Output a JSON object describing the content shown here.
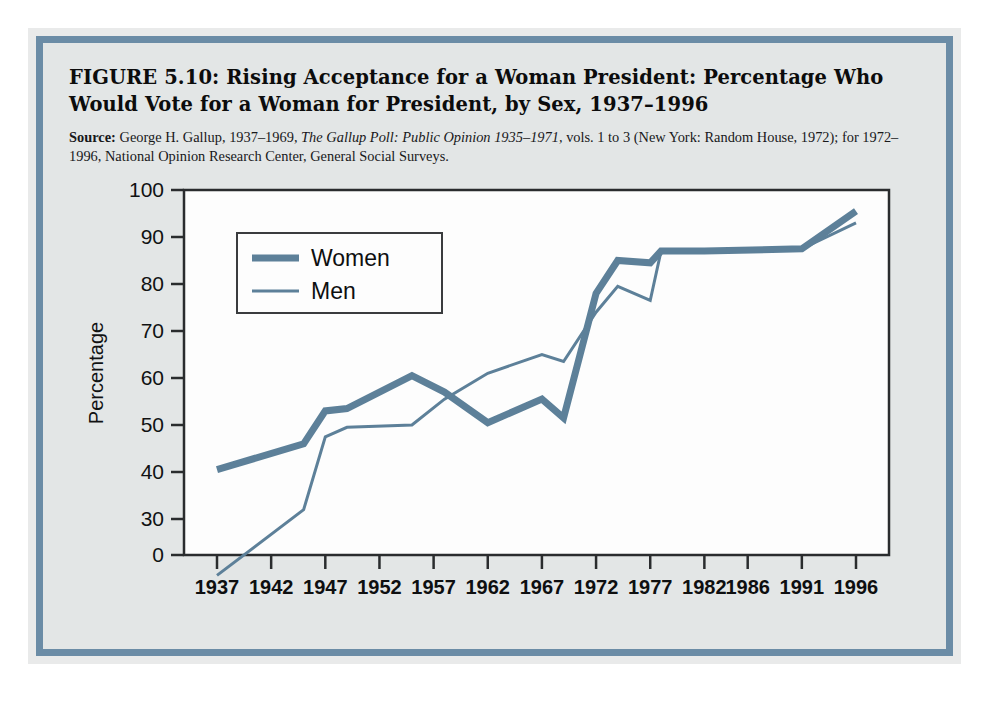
{
  "figure": {
    "title": "FIGURE 5.10:  Rising Acceptance for a Woman President: Percentage Who Would Vote for a Woman for President, by Sex, 1937–1996",
    "source_lead": "Source:",
    "source_part1": " George H. Gallup, 1937–1969, ",
    "source_italic": "The Gallup Poll: Public Opinion 1935–1971,",
    "source_part2": " vols. 1 to 3 (New York: Random House, 1972); for 1972–1996, National Opinion Research Center, General Social Surveys."
  },
  "colors": {
    "line": "#5d8099",
    "frame": "#6b8ca6",
    "panel_bg": "#e3e6e6",
    "plot_bg": "#fdfdfd",
    "axis": "#2a2c2e",
    "text": "#111213"
  },
  "chart_data": {
    "type": "line",
    "title": "Rising Acceptance for a Woman President",
    "xlabel": "",
    "ylabel": "Percentage",
    "xlim": [
      1937,
      1996
    ],
    "ylim": [
      0,
      100
    ],
    "y_axis_break": true,
    "y_ticks": [
      "0",
      "30",
      "40",
      "50",
      "60",
      "70",
      "80",
      "90",
      "100"
    ],
    "x_ticks": [
      "1937",
      "1942",
      "1947",
      "1952",
      "1957",
      "1962",
      "1967",
      "1972",
      "1977",
      "1982",
      "1986",
      "1991",
      "1996"
    ],
    "grid": false,
    "legend_position": "upper-left",
    "series": [
      {
        "name": "Women",
        "style": "thick",
        "x": [
          1937,
          1945,
          1947,
          1949,
          1955,
          1958,
          1962,
          1967,
          1969,
          1972,
          1974,
          1977,
          1978,
          1982,
          1991,
          1996
        ],
        "values": [
          40.5,
          46,
          53,
          53.5,
          60.5,
          57,
          50.5,
          55.5,
          51.5,
          78,
          85,
          84.5,
          87,
          87,
          87.5,
          95.5
        ]
      },
      {
        "name": "Men",
        "style": "thin",
        "x": [
          1937,
          1945,
          1947,
          1949,
          1955,
          1958,
          1962,
          1967,
          1969,
          1972,
          1974,
          1977,
          1978,
          1982,
          1991,
          1996
        ],
        "values": [
          18,
          32,
          47.5,
          49.5,
          50,
          55.5,
          61,
          65,
          63.5,
          74,
          79.5,
          76.5,
          87,
          87,
          87.5,
          93
        ]
      }
    ]
  },
  "legend": {
    "items": [
      {
        "label": "Women"
      },
      {
        "label": "Men"
      }
    ]
  }
}
